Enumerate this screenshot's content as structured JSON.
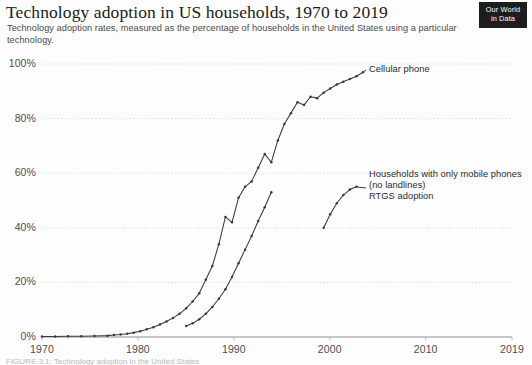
{
  "header": {
    "title": "Technology adoption in US households, 1970 to 2019",
    "subtitle": "Technology adoption rates, measured as the percentage of households in the United States using a particular technology.",
    "logo_line1": "Our World",
    "logo_line2": "in Data"
  },
  "footer": {
    "caption": "FIGURE 3.1: Technology adoption in the United States"
  },
  "annotations": {
    "cellular_phone": "Cellular phone",
    "mobile_only_line1": "Households with only mobile phones",
    "mobile_only_line2": "(no landlines)",
    "mobile_only_line3": "RTGS adoption"
  },
  "colors": {
    "line": "#3a3a3a",
    "grid": "#dcdcdc",
    "axis": "#b4b4b4",
    "text": "#4d4d4d",
    "logo_bg": "#1d1d1d"
  },
  "chart_data": {
    "type": "line",
    "title": "Technology adoption in US households, 1970 to 2019",
    "subtitle": "Technology adoption rates, measured as the percentage of households in the United States using a particular technology.",
    "xlabel": "",
    "ylabel": "",
    "xlim": [
      1970,
      2019
    ],
    "ylim": [
      0,
      100
    ],
    "grid": true,
    "legend_position": "inline-right-annotations",
    "xticks": [
      1970,
      1980,
      1990,
      2000,
      2010,
      2019
    ],
    "xtick_labels": [
      "1970",
      "1980",
      "1990",
      "2000",
      "2010",
      "2019"
    ],
    "yticks": [
      0,
      20,
      40,
      60,
      80,
      100
    ],
    "ytick_labels": [
      "0%",
      "20%",
      "40%",
      "60%",
      "80%",
      "100%"
    ],
    "series": [
      {
        "name": "Cellular phone",
        "label_x": 2011.5,
        "label_y": 97,
        "markers": true,
        "x": [
          1970,
          1972,
          1974,
          1976,
          1978,
          1980,
          1981,
          1982,
          1983,
          1984,
          1985,
          1986,
          1987,
          1988,
          1989,
          1990,
          1991,
          1992,
          1993,
          1994,
          1995,
          1996,
          1997,
          1998,
          1999,
          2000,
          2001,
          2002,
          2003,
          2004,
          2005,
          2006,
          2007,
          2008,
          2009,
          2010,
          2011,
          2012,
          2013,
          2014,
          2015,
          2016,
          2017,
          2018,
          2019
        ],
        "y": [
          0.2,
          0.2,
          0.3,
          0.3,
          0.4,
          0.5,
          0.7,
          0.9,
          1.2,
          1.6,
          2.1,
          2.8,
          3.6,
          4.6,
          5.7,
          7.0,
          8.5,
          10.5,
          13.0,
          16.0,
          21.0,
          26.0,
          34.0,
          44.0,
          42.0,
          51.0,
          55.0,
          57.0,
          62.0,
          67.0,
          64.0,
          72.0,
          78.0,
          82.0,
          86.0,
          85.0,
          88.0,
          87.5,
          89.5,
          91.0,
          92.5,
          93.5,
          94.5,
          95.5,
          97.0
        ]
      },
      {
        "name": "Mobile-only households",
        "markers": true,
        "x": [
          1992,
          1993,
          1994,
          1995,
          1996,
          1997,
          1998,
          1999,
          2000,
          2001,
          2002,
          2003,
          2004,
          2005
        ],
        "y": [
          4.0,
          5.0,
          6.5,
          8.5,
          11.0,
          14.0,
          17.5,
          22.0,
          27.0,
          32.0,
          37.0,
          42.5,
          47.5,
          53.0
        ]
      },
      {
        "name": "RTGS adoption",
        "label_x": 2012.5,
        "label_y": 53,
        "markers": true,
        "x": [
          2013,
          2014,
          2015,
          2016,
          2017,
          2018
        ],
        "y": [
          40.0,
          45.0,
          49.0,
          52.0,
          54.0,
          55.0
        ]
      }
    ]
  }
}
